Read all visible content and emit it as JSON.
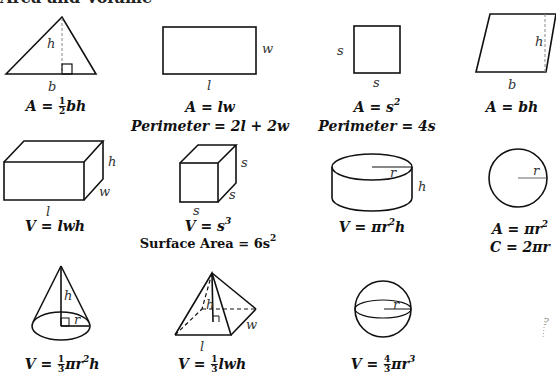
{
  "title": "Area and Volume",
  "shapes": {
    "triangle": {
      "labels": {
        "h": "h",
        "b": "b"
      },
      "formula": {
        "lhs": "A = ",
        "frac_num": "1",
        "frac_den": "2",
        "rhs": "bh"
      }
    },
    "rectangle": {
      "labels": {
        "w": "w",
        "l": "l"
      },
      "formula": "A = lw",
      "perimeter": "Perimeter = 2l + 2w"
    },
    "square": {
      "labels": {
        "s_left": "s",
        "s_bottom": "s"
      },
      "formula": {
        "lhs": "A = s",
        "exp": "2"
      },
      "perimeter": "Perimeter = 4s"
    },
    "parallelogram": {
      "labels": {
        "h": "h",
        "b": "b"
      },
      "formula": "A = bh"
    },
    "rectangular_prism": {
      "labels": {
        "h": "h",
        "w": "w",
        "l": "l"
      },
      "formula": "V = lwh"
    },
    "cube": {
      "labels": {
        "s1": "s",
        "s2": "s",
        "s3": "s"
      },
      "formula": {
        "lhs": "V = s",
        "exp": "3"
      },
      "surface_area": {
        "lhs": "Surface Area = 6s",
        "exp": "2"
      }
    },
    "cylinder": {
      "labels": {
        "r": "r",
        "h": "h"
      },
      "formula": {
        "lhs": "V = πr",
        "exp": "2",
        "rhs": "h"
      }
    },
    "circle": {
      "labels": {
        "r": "r"
      },
      "area": {
        "lhs": "A = πr",
        "exp": "2"
      },
      "circumference": "C = 2πr"
    },
    "cone": {
      "labels": {
        "h": "h",
        "r": "r"
      },
      "formula": {
        "lhs": "V = ",
        "frac_num": "1",
        "frac_den": "3",
        "rhs": "πr",
        "exp": "2",
        "rhs2": "h"
      }
    },
    "pyramid": {
      "labels": {
        "h": "h",
        "w": "w",
        "l": "l"
      },
      "formula": {
        "lhs": "V = ",
        "frac_num": "1",
        "frac_den": "3",
        "rhs": "lwh"
      }
    },
    "sphere": {
      "labels": {
        "r": "r"
      },
      "formula": {
        "lhs": "V = ",
        "frac_num": "4",
        "frac_den": "3",
        "rhs": "πr",
        "exp": "3"
      }
    }
  },
  "stray_marks": "?"
}
